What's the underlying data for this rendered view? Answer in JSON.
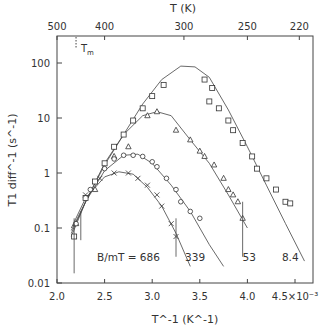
{
  "chart_data": {
    "type": "scatter",
    "title": "",
    "xlabel": "T^-1 (K^-1)",
    "ylabel": "T1 diff^-1 (s^-1)",
    "x_scale_suffix": "×10^-3",
    "xlim": [
      2.0,
      4.7
    ],
    "ylim": [
      0.01,
      300
    ],
    "yscale": "log",
    "grid": false,
    "x_ticks": [
      2.0,
      2.5,
      3.0,
      3.5,
      4.0,
      4.5
    ],
    "x_tick_labels": [
      "2.0",
      "2.5",
      "3.0",
      "3.5",
      "4.0",
      "4.5×10⁻³"
    ],
    "y_ticks": [
      0.01,
      0.1,
      1,
      10,
      100
    ],
    "y_tick_labels": [
      "0.01",
      "0.1",
      "1",
      "10",
      "100"
    ],
    "top_axis": {
      "label": "T (K)",
      "ticks": [
        500,
        400,
        300,
        250,
        220
      ],
      "tick_labels": [
        "500",
        "400",
        "300",
        "250",
        "220"
      ]
    },
    "annotations": [
      {
        "text": "Tm",
        "x": 2.2,
        "y": 160,
        "note": "dotted marker near top axis"
      },
      {
        "text": "B/mT = 686",
        "x": 2.75,
        "y": 0.033
      },
      {
        "text": "339",
        "x": 3.45,
        "y": 0.033
      },
      {
        "text": "53",
        "x": 4.02,
        "y": 0.033
      },
      {
        "text": "8.4",
        "x": 4.45,
        "y": 0.033
      }
    ],
    "legend": null,
    "series": [
      {
        "name": "B = 8.4 mT",
        "marker": "square",
        "fit_curve": {
          "x": [
            2.15,
            2.3,
            2.5,
            2.7,
            2.9,
            3.1,
            3.3,
            3.45,
            3.6,
            3.8,
            4.0,
            4.2,
            4.4,
            4.6
          ],
          "y": [
            0.07,
            0.3,
            1.4,
            5,
            18,
            50,
            88,
            85,
            55,
            14,
            3,
            0.6,
            0.12,
            0.025
          ]
        },
        "points": {
          "x": [
            2.18,
            2.3,
            2.4,
            2.5,
            2.6,
            2.7,
            2.8,
            2.9,
            3.0,
            3.12,
            3.55,
            3.63,
            3.6,
            3.7,
            3.8,
            3.85,
            3.95,
            4.05,
            4.1,
            4.2,
            4.3,
            4.4,
            4.45
          ],
          "y": [
            0.07,
            0.35,
            0.7,
            1.5,
            3,
            5,
            9,
            15,
            25,
            40,
            50,
            35,
            20,
            15,
            9,
            6,
            3.5,
            2,
            1.2,
            0.8,
            0.5,
            0.3,
            0.28
          ]
        }
      },
      {
        "name": "B = 53 mT",
        "marker": "triangle",
        "fit_curve": {
          "x": [
            2.15,
            2.3,
            2.5,
            2.7,
            2.9,
            3.05,
            3.2,
            3.4,
            3.6,
            3.8,
            4.0
          ],
          "y": [
            0.08,
            0.3,
            1.5,
            5,
            11,
            13,
            11,
            4,
            1.5,
            0.4,
            0.1
          ]
        },
        "points": {
          "x": [
            2.2,
            2.4,
            2.6,
            2.75,
            2.95,
            3.05,
            3.25,
            3.4,
            3.5,
            3.55,
            3.65,
            3.75,
            3.8,
            3.85,
            3.9,
            3.95
          ],
          "y": [
            0.12,
            0.5,
            2,
            3,
            11,
            13,
            6,
            4,
            2.5,
            2,
            1.4,
            0.8,
            0.5,
            0.4,
            0.3,
            0.15
          ]
        }
      },
      {
        "name": "B = 339 mT",
        "marker": "circle",
        "fit_curve": {
          "x": [
            2.15,
            2.3,
            2.5,
            2.7,
            2.85,
            3.0,
            3.2,
            3.4,
            3.6,
            3.75
          ],
          "y": [
            0.09,
            0.3,
            1.1,
            2.1,
            2.2,
            1.5,
            0.6,
            0.2,
            0.05,
            0.02
          ]
        },
        "points": {
          "x": [
            2.2,
            2.35,
            2.5,
            2.6,
            2.7,
            2.8,
            2.9,
            3.0,
            3.05,
            3.15,
            3.25,
            3.3,
            3.4,
            3.5
          ],
          "y": [
            0.12,
            0.5,
            1.2,
            1.8,
            2.1,
            2.1,
            2,
            1.6,
            1.3,
            0.8,
            0.5,
            0.3,
            0.2,
            0.15
          ]
        }
      },
      {
        "name": "B = 686 mT",
        "marker": "cross",
        "fit_curve": {
          "x": [
            2.15,
            2.3,
            2.5,
            2.65,
            2.8,
            2.95,
            3.1,
            3.25,
            3.4
          ],
          "y": [
            0.1,
            0.35,
            0.85,
            1.05,
            0.95,
            0.55,
            0.25,
            0.08,
            0.02
          ]
        },
        "points": {
          "x": [
            2.3,
            2.45,
            2.6,
            2.75,
            2.85,
            2.95,
            3.05,
            3.1,
            3.2,
            3.25
          ],
          "y": [
            0.4,
            0.8,
            1.0,
            1.0,
            0.8,
            0.6,
            0.4,
            0.25,
            0.12,
            0.07
          ]
        }
      }
    ]
  }
}
